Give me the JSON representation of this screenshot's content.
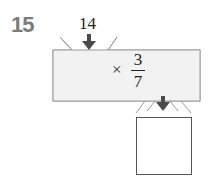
{
  "problem": {
    "number": "15",
    "input_value": "14",
    "operation": {
      "operator": "×",
      "fraction": {
        "numerator": "3",
        "denominator": "7"
      }
    },
    "answer": ""
  },
  "colors": {
    "problem_number": "#7c7c7c",
    "machine_fill": "#f2f2f2",
    "machine_stroke": "#9a9a9a",
    "arrow": "#4a4a4a"
  }
}
